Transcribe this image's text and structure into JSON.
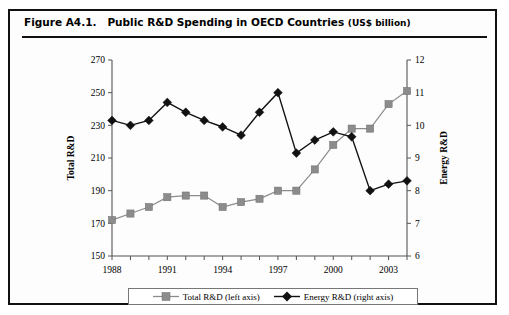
{
  "figure": {
    "label": "Figure A4.1.",
    "title": "Public R&D Spending in OECD Countries",
    "units": "(US$ billion)"
  },
  "legend": {
    "total": "Total R&D (left axis)",
    "energy": "Energy R&D (right axis)",
    "total_marker": "square-marker-icon",
    "energy_marker": "diamond-marker-icon"
  },
  "colors": {
    "total_series": "#8c8c8c",
    "energy_series": "#111111",
    "axis": "#555555",
    "frame": "#111111"
  },
  "chart_data": {
    "type": "line",
    "title": "Public R&D Spending in OECD Countries (US$ billion)",
    "xlabel": "",
    "ylabel": "Total R&D",
    "y2label": "Energy R&D",
    "grid": false,
    "legend_position": "bottom",
    "x": [
      1988,
      1989,
      1990,
      1991,
      1992,
      1993,
      1994,
      1995,
      1996,
      1997,
      1998,
      1999,
      2000,
      2001,
      2002,
      2003,
      2004
    ],
    "xtick_labels": [
      "1988",
      "1991",
      "1994",
      "1997",
      "2000",
      "2003"
    ],
    "xtick_values": [
      1988,
      1991,
      1994,
      1997,
      2000,
      2003
    ],
    "ylim": [
      150,
      270
    ],
    "yticks": [
      150,
      170,
      190,
      210,
      230,
      250,
      270
    ],
    "y2lim": [
      6,
      12
    ],
    "y2ticks": [
      6,
      7,
      8,
      9,
      10,
      11,
      12
    ],
    "series": [
      {
        "name": "Total R&D (left axis)",
        "axis": "left",
        "marker": "square",
        "color": "#8c8c8c",
        "values": [
          172,
          176,
          180,
          186,
          187,
          187,
          180,
          183,
          185,
          190,
          190,
          203,
          218,
          228,
          228,
          243,
          251
        ]
      },
      {
        "name": "Energy R&D (right axis)",
        "axis": "right",
        "marker": "diamond",
        "color": "#111111",
        "values": [
          10.15,
          10.0,
          10.15,
          10.7,
          10.4,
          10.15,
          9.95,
          9.7,
          10.4,
          11.0,
          9.15,
          9.55,
          9.8,
          9.65,
          8.0,
          8.2,
          8.3
        ]
      }
    ]
  }
}
